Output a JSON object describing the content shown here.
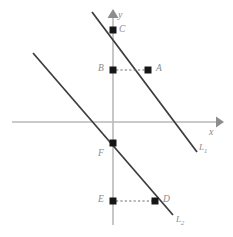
{
  "figure": {
    "background_color": "#ffffff",
    "axis_color": "#b9b9b9",
    "line_color": "#3b3b3b",
    "point_color": "#161616",
    "label_color": "#8a8a8a",
    "dash_color": "#6f6f6f"
  },
  "axes": {
    "x_axis_label": "x",
    "y_axis_label": "y",
    "x_axis": {
      "x1": 12,
      "y1": 122,
      "x2": 218,
      "y2": 122
    },
    "y_axis": {
      "x1": 113,
      "y1": 16,
      "x2": 113,
      "y2": 225
    },
    "x_label_pos": {
      "x": 209,
      "y": 128
    },
    "y_label_pos": {
      "x": 118,
      "y": 13
    }
  },
  "lines": [
    {
      "name": "L1",
      "label": "L",
      "subscript": "1",
      "x1": 92,
      "y1": 12,
      "x2": 197,
      "y2": 152,
      "label_pos": {
        "x": 199,
        "y": 144
      }
    },
    {
      "name": "L2",
      "label": "L",
      "subscript": "2",
      "x1": 33,
      "y1": 53,
      "x2": 173,
      "y2": 215,
      "label_pos": {
        "x": 176,
        "y": 216
      }
    }
  ],
  "points": [
    {
      "name": "C",
      "label": "C",
      "x": 113,
      "y": 30,
      "label_pos": {
        "x": 119,
        "y": 26
      },
      "on_line": "L1"
    },
    {
      "name": "B",
      "label": "B",
      "x": 113,
      "y": 70,
      "label_pos": {
        "x": 99,
        "y": 65
      },
      "on_line": "y-axis"
    },
    {
      "name": "A",
      "label": "A",
      "x": 148,
      "y": 70,
      "label_pos": {
        "x": 156,
        "y": 65
      },
      "on_line": "L1"
    },
    {
      "name": "F",
      "label": "F",
      "x": 113,
      "y": 143,
      "label_pos": {
        "x": 99,
        "y": 150
      },
      "on_line": "L2"
    },
    {
      "name": "E",
      "label": "E",
      "x": 113,
      "y": 201,
      "label_pos": {
        "x": 99,
        "y": 196
      },
      "on_line": "y-axis"
    },
    {
      "name": "D",
      "label": "D",
      "x": 155,
      "y": 201,
      "label_pos": {
        "x": 163,
        "y": 196
      },
      "on_line": "L2"
    }
  ],
  "connectors": [
    {
      "name": "BA",
      "from": "B",
      "to": "A",
      "x1": 115,
      "y1": 70,
      "x2": 146,
      "y2": 70,
      "style": "dashed"
    },
    {
      "name": "ED",
      "from": "E",
      "to": "D",
      "x1": 115,
      "y1": 201,
      "x2": 153,
      "y2": 201,
      "style": "dashed"
    }
  ]
}
